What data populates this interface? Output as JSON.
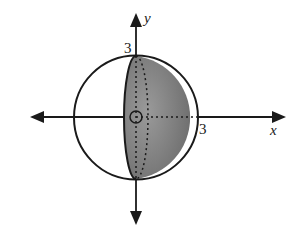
{
  "diagram": {
    "axes": {
      "x_label": "x",
      "y_label": "y"
    },
    "ticks": {
      "x_tick": "3",
      "y_tick": "3"
    },
    "radius": 3,
    "colors": {
      "shade": "#7a7a7a",
      "stroke": "#1a1a1a",
      "background": "#ffffff"
    }
  }
}
